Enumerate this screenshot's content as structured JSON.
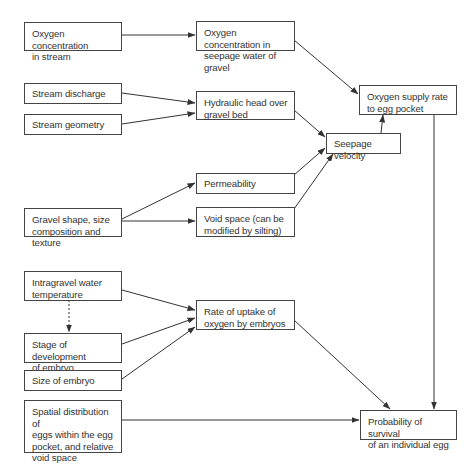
{
  "diagram": {
    "type": "flowchart",
    "nodes": {
      "o2_stream": "Oxygen concentration in stream",
      "stream_discharge": "Stream discharge",
      "stream_geometry": "Stream geometry",
      "gravel_shape": "Gravel shape, size composition and texture",
      "water_temp": "Intragravel water temperature",
      "stage_dev": "Stage of development of embryo",
      "size_embryo": "Size of embryo",
      "spatial_dist": "Spatial distribution of eggs within the egg pocket, and relative void space",
      "o2_seepage": "Oxygen concentration in seepage water of gravel",
      "hydraulic_head": "Hydraulic head over gravel bed",
      "permeability": "Permeability",
      "void_space": "Void space (can be modified by silting)",
      "rate_uptake": "Rate of uptake of oxygen by embryos",
      "seepage_velocity": "Seepage velocity",
      "o2_supply": "Oxygen supply rate to egg pocket",
      "survival": "Probability of survival of an individual egg"
    },
    "lines": {
      "o2_stream": [
        "Oxygen concentration",
        "in stream"
      ],
      "stream_discharge": [
        "Stream discharge"
      ],
      "stream_geometry": [
        "Stream geometry"
      ],
      "gravel_shape": [
        "Gravel shape, size",
        "composition and texture"
      ],
      "water_temp": [
        "Intragravel water",
        "temperature"
      ],
      "stage_dev": [
        "Stage of development",
        "of embryo"
      ],
      "size_embryo": [
        "Size of embryo"
      ],
      "spatial_dist": [
        "Spatial distribution of",
        "eggs within the egg",
        "pocket, and relative",
        "void space"
      ],
      "o2_seepage": [
        "Oxygen concentration in",
        "seepage water of gravel"
      ],
      "hydraulic_head": [
        "Hydraulic head over",
        "gravel bed"
      ],
      "permeability": [
        "Permeability"
      ],
      "void_space": [
        "Void space (can be",
        "modified by silting)"
      ],
      "rate_uptake": [
        "Rate of uptake of",
        "oxygen by embryos"
      ],
      "seepage_velocity": [
        "Seepage velocity"
      ],
      "o2_supply": [
        "Oxygen supply rate",
        "to egg pocket"
      ],
      "survival": [
        "Probability of survival",
        "of an individual egg"
      ]
    },
    "edges": [
      {
        "from": "o2_stream",
        "to": "o2_seepage",
        "style": "solid"
      },
      {
        "from": "stream_discharge",
        "to": "hydraulic_head",
        "style": "solid"
      },
      {
        "from": "stream_geometry",
        "to": "hydraulic_head",
        "style": "solid"
      },
      {
        "from": "gravel_shape",
        "to": "permeability",
        "style": "solid"
      },
      {
        "from": "gravel_shape",
        "to": "void_space",
        "style": "solid"
      },
      {
        "from": "o2_seepage",
        "to": "o2_supply",
        "style": "solid"
      },
      {
        "from": "hydraulic_head",
        "to": "seepage_velocity",
        "style": "solid"
      },
      {
        "from": "permeability",
        "to": "seepage_velocity",
        "style": "solid"
      },
      {
        "from": "void_space",
        "to": "seepage_velocity",
        "style": "solid"
      },
      {
        "from": "seepage_velocity",
        "to": "o2_supply",
        "style": "solid"
      },
      {
        "from": "o2_supply",
        "to": "survival",
        "style": "solid"
      },
      {
        "from": "water_temp",
        "to": "stage_dev",
        "style": "dotted"
      },
      {
        "from": "water_temp",
        "to": "rate_uptake",
        "style": "solid"
      },
      {
        "from": "stage_dev",
        "to": "rate_uptake",
        "style": "solid"
      },
      {
        "from": "size_embryo",
        "to": "rate_uptake",
        "style": "solid"
      },
      {
        "from": "rate_uptake",
        "to": "survival",
        "style": "solid"
      },
      {
        "from": "spatial_dist",
        "to": "survival",
        "style": "solid"
      }
    ],
    "colors": {
      "line": "#333333",
      "border": "#444444",
      "text": "#333333",
      "background": "#ffffff"
    }
  }
}
